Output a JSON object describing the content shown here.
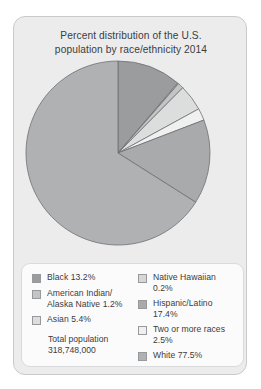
{
  "chart_data": {
    "type": "pie",
    "title": "Percent distribution of the U.S. population by race/ethnicity 2014",
    "title_lines": [
      "Percent distribution of the U.S.",
      "population by race/ethnicity 2014"
    ],
    "categories": [
      "Black",
      "Native Hawaiian",
      "American Indian/Alaska Native",
      "Asian",
      "Two or more races",
      "Hispanic/Latino",
      "White"
    ],
    "values": [
      13.2,
      0.2,
      1.2,
      5.4,
      2.5,
      17.4,
      77.5
    ],
    "value_labels": [
      "13.2%",
      "0.2%",
      "1.2%",
      "5.4%",
      "2.5%",
      "17.4%",
      "77.5%"
    ],
    "units": "percent",
    "start_angle_deg": 0,
    "direction": "clockwise",
    "note": "Percentages sum to more than 100 because Hispanic/Latino is an ethnicity counted across races.",
    "total_population_label": "Total population",
    "total_population_value": "318,748,000",
    "legend_position": "bottom",
    "grid": false,
    "slice_colors": [
      "#9b9c9e",
      "#d6d7d8",
      "#c3c4c5",
      "#dcdddd",
      "#f0f0f0",
      "#a9aaac",
      "#b0b1b3"
    ],
    "slice_stroke": "#6f7072"
  },
  "card": {
    "background_color": "#ececed",
    "border_color": "#c9cacb"
  },
  "legend": {
    "background_color": "#fbfbfb",
    "border_color": "#d9dadb",
    "columns": [
      {
        "entries": [
          {
            "swatch_color": "#9b9c9e",
            "lines": [
              "Black 13.2%"
            ]
          },
          {
            "swatch_color": "#c3c4c5",
            "lines": [
              "American Indian/",
              "Alaska Native 1.2%"
            ]
          },
          {
            "swatch_color": "#dcdddd",
            "lines": [
              "Asian 5.4%"
            ]
          }
        ],
        "total": {
          "lines": [
            "Total population",
            "318,748,000"
          ]
        }
      },
      {
        "entries": [
          {
            "swatch_color": "#d6d7d8",
            "lines": [
              "Native Hawaiian",
              "0.2%"
            ]
          },
          {
            "swatch_color": "#a9aaac",
            "lines": [
              "Hispanic/Latino",
              "17.4%"
            ]
          },
          {
            "swatch_color": "#f0f0f0",
            "lines": [
              "Two or more races",
              "2.5%"
            ]
          },
          {
            "swatch_color": "#b0b1b3",
            "lines": [
              "White 77.5%"
            ]
          }
        ]
      }
    ]
  }
}
